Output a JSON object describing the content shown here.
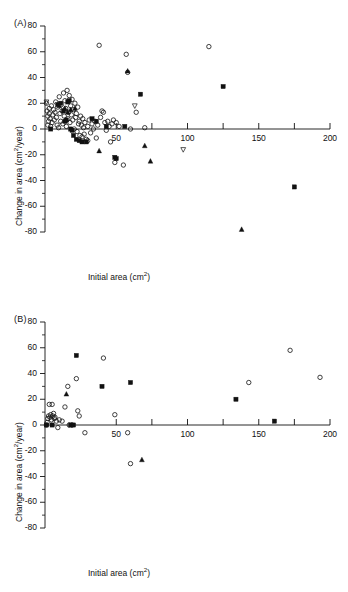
{
  "figure": {
    "width": 348,
    "height": 592,
    "background": "#ffffff",
    "ink_color": "#111111"
  },
  "chart_data": [
    {
      "type": "scatter",
      "panel": "A",
      "panel_tag": "(A)",
      "title": "",
      "xlabel": "Initial area (cm2)",
      "ylabel": "Change in area (cm2/year)",
      "xlim": [
        0,
        200
      ],
      "ylim": [
        -80,
        80
      ],
      "grid": false,
      "legend": "none",
      "x_major_ticks": [
        50,
        100,
        150,
        200
      ],
      "x_minor_ticks": [
        75,
        125,
        175
      ],
      "x_tick_labels": [
        "50",
        "100",
        "150",
        "200"
      ],
      "y_major_ticks": [
        80,
        60,
        40,
        20,
        0,
        -20,
        -40,
        -60,
        -80
      ],
      "y_minor_ticks": [
        70,
        50,
        30,
        10,
        -10,
        -30,
        -50,
        -70
      ],
      "y_tick_labels": [
        "80",
        "60",
        "40",
        "20",
        "0",
        "-20",
        "-40",
        "-60",
        "-80"
      ],
      "axis_zero_line_y": 0,
      "series": [
        {
          "name": "open-circle",
          "marker": "circle-open",
          "points": [
            [
              1,
              20
            ],
            [
              1.5,
              14
            ],
            [
              2,
              10
            ],
            [
              2,
              3
            ],
            [
              2.5,
              6
            ],
            [
              3,
              16
            ],
            [
              3,
              12
            ],
            [
              3.5,
              8
            ],
            [
              4,
              2
            ],
            [
              4.5,
              18
            ],
            [
              5,
              5
            ],
            [
              5.5,
              11
            ],
            [
              6,
              15
            ],
            [
              6.5,
              7
            ],
            [
              7,
              13
            ],
            [
              7.5,
              21
            ],
            [
              8,
              9
            ],
            [
              8.5,
              3
            ],
            [
              9,
              17
            ],
            [
              9.5,
              1
            ],
            [
              10,
              25
            ],
            [
              10.5,
              12
            ],
            [
              11,
              6
            ],
            [
              11.5,
              19
            ],
            [
              12,
              14
            ],
            [
              12.5,
              4
            ],
            [
              13,
              28
            ],
            [
              13.5,
              10
            ],
            [
              14,
              22
            ],
            [
              14.5,
              16
            ],
            [
              15,
              2
            ],
            [
              15.5,
              30
            ],
            [
              16,
              8
            ],
            [
              16.5,
              13
            ],
            [
              17,
              26
            ],
            [
              17.5,
              5
            ],
            [
              18,
              18
            ],
            [
              18.5,
              11
            ],
            [
              19,
              23
            ],
            [
              19.5,
              7
            ],
            [
              20,
              15
            ],
            [
              20.5,
              0
            ],
            [
              21,
              20
            ],
            [
              21.5,
              9
            ],
            [
              22,
              12
            ],
            [
              22.5,
              -2
            ],
            [
              23,
              17
            ],
            [
              23.5,
              4
            ],
            [
              24,
              6
            ],
            [
              24.5,
              -5
            ],
            [
              25,
              10
            ],
            [
              25.5,
              3
            ],
            [
              26,
              -6
            ],
            [
              26.5,
              8
            ],
            [
              27,
              1
            ],
            [
              27.5,
              -4
            ],
            [
              28,
              5
            ],
            [
              29,
              -8
            ],
            [
              30,
              2
            ],
            [
              30,
              -9
            ],
            [
              31,
              7
            ],
            [
              32,
              -3
            ],
            [
              33,
              4
            ],
            [
              34,
              0
            ],
            [
              35,
              6
            ],
            [
              36,
              -7
            ],
            [
              37,
              3
            ],
            [
              38,
              65
            ],
            [
              39,
              9
            ],
            [
              40,
              14
            ],
            [
              41,
              13
            ],
            [
              42,
              5
            ],
            [
              43,
              -1
            ],
            [
              44,
              6
            ],
            [
              45,
              2
            ],
            [
              46,
              -10
            ],
            [
              47,
              4
            ],
            [
              48,
              7
            ],
            [
              49,
              -26
            ],
            [
              50,
              5
            ],
            [
              52,
              2
            ],
            [
              55,
              -28
            ],
            [
              57,
              58
            ],
            [
              58,
              44
            ],
            [
              60,
              0
            ],
            [
              64,
              13
            ],
            [
              70,
              1
            ],
            [
              115,
              64
            ]
          ]
        },
        {
          "name": "filled-square",
          "marker": "square-filled",
          "points": [
            [
              4,
              0
            ],
            [
              9,
              19
            ],
            [
              11,
              20
            ],
            [
              13,
              14
            ],
            [
              14,
              6
            ],
            [
              15,
              7
            ],
            [
              16,
              21
            ],
            [
              17,
              22
            ],
            [
              18,
              0
            ],
            [
              19,
              -1
            ],
            [
              20,
              -5
            ],
            [
              22,
              -8
            ],
            [
              24,
              -9
            ],
            [
              26,
              -10
            ],
            [
              29,
              -10
            ],
            [
              33,
              8
            ],
            [
              36,
              6
            ],
            [
              43,
              2
            ],
            [
              49,
              -22
            ],
            [
              50,
              -23
            ],
            [
              56,
              2
            ],
            [
              67,
              27
            ],
            [
              125,
              33
            ],
            [
              175,
              -45
            ]
          ]
        },
        {
          "name": "filled-triangle",
          "marker": "triangle-filled",
          "points": [
            [
              10,
              18
            ],
            [
              14,
              16
            ],
            [
              16,
              13
            ],
            [
              18,
              15
            ],
            [
              21,
              16
            ],
            [
              38,
              -17
            ],
            [
              58,
              45
            ],
            [
              70,
              -13
            ],
            [
              74,
              -25
            ],
            [
              138,
              -78
            ]
          ]
        },
        {
          "name": "down-triangle",
          "marker": "triangle-down",
          "points": [
            [
              1,
              21
            ],
            [
              63,
              18
            ],
            [
              97,
              -16
            ]
          ]
        }
      ]
    },
    {
      "type": "scatter",
      "panel": "B",
      "panel_tag": "(B)",
      "title": "",
      "xlabel": "Initial area (cm2)",
      "ylabel": "Change in area (cm2/year)",
      "xlim": [
        0,
        200
      ],
      "ylim": [
        -80,
        80
      ],
      "grid": false,
      "legend": "none",
      "x_major_ticks": [
        50,
        100,
        150,
        200
      ],
      "x_minor_ticks": [
        75,
        125,
        175
      ],
      "x_tick_labels": [
        "50",
        "100",
        "150",
        "200"
      ],
      "y_major_ticks": [
        80,
        60,
        40,
        20,
        0,
        -20,
        -40,
        -60,
        -80
      ],
      "y_minor_ticks": [
        70,
        50,
        30,
        10,
        -10,
        -30,
        -50,
        -70
      ],
      "y_tick_labels": [
        "80",
        "60",
        "40",
        "20",
        "0",
        "-20",
        "-40",
        "-60",
        "-80"
      ],
      "axis_zero_line_y": 0,
      "series": [
        {
          "name": "open-circle",
          "marker": "circle-open",
          "points": [
            [
              1,
              0
            ],
            [
              1.5,
              2
            ],
            [
              2,
              5
            ],
            [
              2.5,
              7
            ],
            [
              3,
              16
            ],
            [
              3.5,
              6
            ],
            [
              4,
              8
            ],
            [
              4.5,
              4
            ],
            [
              5,
              16
            ],
            [
              5.5,
              7
            ],
            [
              6,
              9
            ],
            [
              6.5,
              5
            ],
            [
              7,
              6
            ],
            [
              8,
              3
            ],
            [
              9,
              -2
            ],
            [
              10,
              4
            ],
            [
              12,
              3
            ],
            [
              14,
              14
            ],
            [
              16,
              30
            ],
            [
              17,
              0
            ],
            [
              19,
              0
            ],
            [
              22,
              36
            ],
            [
              23,
              11
            ],
            [
              24,
              7
            ],
            [
              28,
              -6
            ],
            [
              41,
              52
            ],
            [
              49,
              8
            ],
            [
              58,
              -6
            ],
            [
              60,
              -30
            ],
            [
              143,
              33
            ],
            [
              172,
              58
            ],
            [
              193,
              37
            ]
          ]
        },
        {
          "name": "filled-square",
          "marker": "square-filled",
          "points": [
            [
              1,
              0
            ],
            [
              5,
              0
            ],
            [
              18,
              0
            ],
            [
              20,
              0
            ],
            [
              22,
              54
            ],
            [
              40,
              30
            ],
            [
              60,
              33
            ],
            [
              134,
              20
            ],
            [
              161,
              3
            ]
          ]
        },
        {
          "name": "filled-triangle",
          "marker": "triangle-filled",
          "points": [
            [
              15,
              24
            ],
            [
              68,
              -27
            ]
          ]
        },
        {
          "name": "down-triangle",
          "marker": "triangle-down",
          "points": []
        }
      ]
    }
  ]
}
